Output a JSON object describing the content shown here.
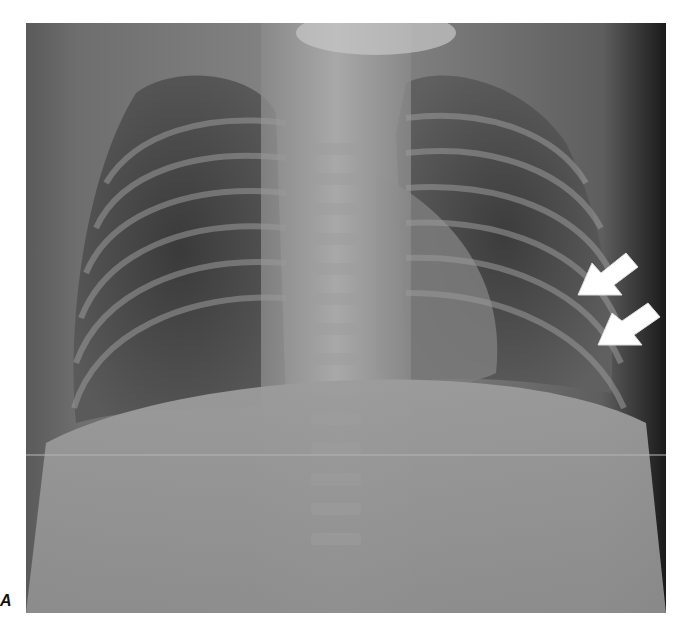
{
  "figure": {
    "panel_label": "A",
    "image": {
      "type": "chest radiograph",
      "view": "frontal",
      "description": "Frontal chest X-ray of a child showing ribs, lungs, mediastinum and upper abdomen"
    },
    "annotations": [
      {
        "type": "arrow",
        "icon": "arrow-icon",
        "color": "#ffffff",
        "direction": "down-left",
        "position": "right lateral chest wall, upper"
      },
      {
        "type": "arrow",
        "icon": "arrow-icon",
        "color": "#ffffff",
        "direction": "down-left",
        "position": "right lateral chest wall, lower"
      }
    ]
  }
}
